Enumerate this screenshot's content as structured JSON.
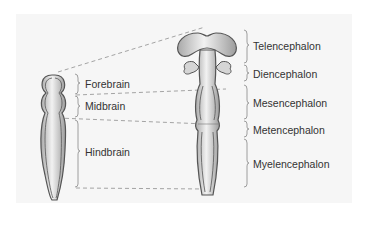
{
  "diagram": {
    "type": "embryonic-brain-vesicles",
    "colors": {
      "panel_bg": "#f6f6f6",
      "tissue_fill": "#d9d9d9",
      "tissue_outline": "#555555",
      "dashed_line": "#9a9a9a",
      "label_text": "#333333"
    },
    "left_stage": {
      "name": "three-vesicle-stage",
      "labels": [
        {
          "id": "forebrain",
          "text": "Forebrain"
        },
        {
          "id": "midbrain",
          "text": "Midbrain"
        },
        {
          "id": "hindbrain",
          "text": "Hindbrain"
        }
      ]
    },
    "right_stage": {
      "name": "five-vesicle-stage",
      "labels": [
        {
          "id": "telencephalon",
          "text": "Telencephalon"
        },
        {
          "id": "diencephalon",
          "text": "Diencephalon"
        },
        {
          "id": "mesencephalon",
          "text": "Mesencephalon"
        },
        {
          "id": "metencephalon",
          "text": "Metencephalon"
        },
        {
          "id": "myelencephalon",
          "text": "Myelencephalon"
        }
      ]
    }
  }
}
